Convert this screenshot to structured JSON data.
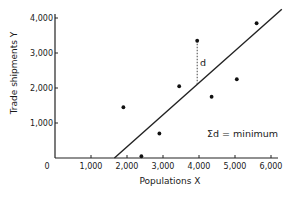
{
  "chart_data": {
    "type": "scatter",
    "title": "",
    "xlabel": "Populations X",
    "ylabel": "Trade shipments Y",
    "xlim": [
      0,
      6200
    ],
    "ylim": [
      0,
      4200
    ],
    "x_ticks": [
      0,
      1000,
      2000,
      3000,
      4000,
      5000,
      6000
    ],
    "x_tick_labels": [
      "0",
      "1,000",
      "2,000",
      "3,000",
      "4,000",
      "5,000",
      "6,000"
    ],
    "y_ticks": [
      1000,
      2000,
      3000,
      4000
    ],
    "y_tick_labels": [
      "1,000",
      "2,000",
      "3,000",
      "4,000"
    ],
    "grid": false,
    "legend": null,
    "series": [
      {
        "name": "observations",
        "type": "scatter",
        "points": [
          {
            "x": 1900,
            "y": 1450
          },
          {
            "x": 2400,
            "y": 50
          },
          {
            "x": 2900,
            "y": 700
          },
          {
            "x": 3450,
            "y": 2050
          },
          {
            "x": 3950,
            "y": 3350
          },
          {
            "x": 4350,
            "y": 1750
          },
          {
            "x": 5050,
            "y": 2250
          },
          {
            "x": 5600,
            "y": 3850
          }
        ]
      },
      {
        "name": "regression line",
        "type": "line",
        "points": [
          {
            "x": 1650,
            "y": 0
          },
          {
            "x": 6300,
            "y": 4250
          }
        ]
      }
    ],
    "annotations": [
      {
        "text": "d",
        "type": "dashed residual",
        "from": {
          "x": 3950,
          "y": 3350
        },
        "to": {
          "x": 3950,
          "y": 2100
        }
      },
      {
        "text": "Σd = minimum",
        "position": {
          "x": 5000,
          "y": 750
        }
      }
    ]
  },
  "labels": {
    "origin": "0",
    "residual": "d",
    "equation": "Σd = minimum"
  }
}
